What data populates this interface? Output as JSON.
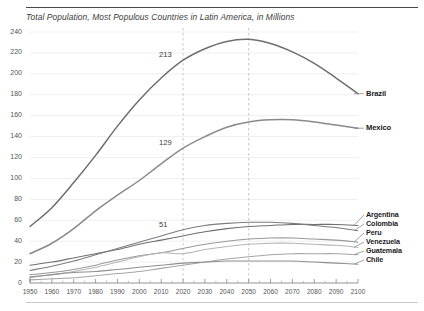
{
  "figure": {
    "title": "Total Population, Most Populous Countries in Latin America, in Millions"
  },
  "chart_data": {
    "type": "line",
    "title": "Total Population, Most Populous Countries in Latin America, in Millions",
    "xlabel": "",
    "ylabel": "",
    "xlim": [
      1950,
      2100
    ],
    "ylim": [
      0,
      240
    ],
    "yticks": [
      0,
      20,
      40,
      60,
      80,
      100,
      120,
      140,
      160,
      180,
      200,
      220,
      240
    ],
    "xticks": [
      1950,
      1960,
      1970,
      1980,
      1990,
      2000,
      2010,
      2020,
      2030,
      2040,
      2050,
      2060,
      2070,
      2080,
      2090,
      2100
    ],
    "grid": "horizontal",
    "legend_position": "right-inline-labels",
    "reference_lines": [
      {
        "x": 2020,
        "style": "dashed"
      },
      {
        "x": 2050,
        "style": "dashed"
      }
    ],
    "annotations": [
      {
        "text": "213",
        "x": 2020,
        "y": 213,
        "series": "Brazil"
      },
      {
        "text": "129",
        "x": 2020,
        "y": 129,
        "series": "Mexico"
      },
      {
        "text": "51",
        "x": 2020,
        "y": 51,
        "series": "Colombia"
      }
    ],
    "x": [
      1950,
      1960,
      1970,
      1980,
      1990,
      2000,
      2010,
      2020,
      2030,
      2040,
      2050,
      2060,
      2070,
      2080,
      2090,
      2100
    ],
    "series": [
      {
        "name": "Brazil",
        "color": "#6e6e6e",
        "values": [
          54,
          72,
          96,
          122,
          150,
          175,
          196,
          213,
          224,
          231,
          233,
          229,
          221,
          210,
          196,
          181
        ]
      },
      {
        "name": "Mexico",
        "color": "#8a8a8a",
        "values": [
          28,
          38,
          52,
          69,
          84,
          98,
          114,
          129,
          140,
          149,
          154,
          156,
          156,
          154,
          151,
          148
        ]
      },
      {
        "name": "Argentina",
        "color": "#6f6f6f",
        "values": [
          17,
          20,
          24,
          28,
          32,
          37,
          41,
          45,
          49,
          52,
          54,
          55,
          56,
          56,
          56,
          55
        ]
      },
      {
        "name": "Colombia",
        "color": "#7c7c7c",
        "values": [
          12,
          16,
          21,
          27,
          33,
          39,
          45,
          51,
          55,
          57,
          58,
          58,
          57,
          55,
          53,
          50
        ]
      },
      {
        "name": "Peru",
        "color": "#999999",
        "values": [
          8,
          10,
          13,
          17,
          22,
          26,
          29,
          33,
          37,
          40,
          42,
          43,
          43,
          42,
          41,
          39
        ]
      },
      {
        "name": "Venezuela",
        "color": "#b5b5b5",
        "values": [
          5,
          8,
          11,
          15,
          20,
          25,
          29,
          28,
          32,
          35,
          37,
          38,
          38,
          37,
          36,
          34
        ]
      },
      {
        "name": "Guatemala",
        "color": "#a5a5a5",
        "values": [
          3,
          4,
          5,
          7,
          9,
          11,
          14,
          17,
          20,
          23,
          25,
          27,
          28,
          28,
          28,
          27
        ]
      },
      {
        "name": "Chile",
        "color": "#8f8f8f",
        "values": [
          6,
          8,
          10,
          11,
          13,
          15,
          17,
          19,
          20,
          21,
          21,
          21,
          21,
          20,
          19,
          18
        ]
      }
    ]
  },
  "axis": {
    "y_labels": [
      "240",
      "220",
      "200",
      "180",
      "160",
      "140",
      "120",
      "100",
      "80",
      "60",
      "40",
      "20",
      "0"
    ],
    "x_labels": [
      "1950",
      "1960",
      "1970",
      "1980",
      "1990",
      "2000",
      "2010",
      "2020",
      "2030",
      "2040",
      "2050",
      "2060",
      "2070",
      "2080",
      "2090",
      "2100"
    ]
  },
  "labels": {
    "brazil": "Brazil",
    "mexico": "Mexico",
    "argentina": "Argentina",
    "colombia": "Colombia",
    "peru": "Peru",
    "venezuela": "Venezuela",
    "guatemala": "Guatemala",
    "chile": "Chile"
  },
  "annotations": {
    "brazil_2020": "213",
    "mexico_2020": "129",
    "colombia_2020": "51"
  }
}
